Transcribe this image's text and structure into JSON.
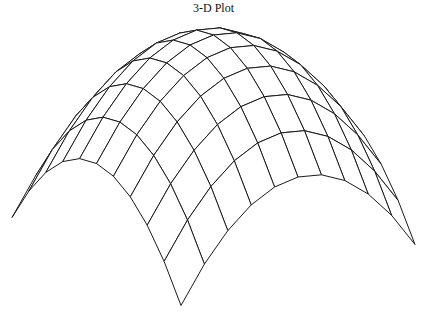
{
  "chart_data": {
    "type": "surface-wireframe",
    "title": "3-D Plot",
    "xlabel": "",
    "ylabel": "",
    "zlabel": "",
    "axes_visible": false,
    "grid": false,
    "legend": null,
    "function": "z = -(x^2 + y^2)",
    "x_range": [
      -1,
      1
    ],
    "y_range": [
      -1,
      1
    ],
    "grid_points": 11,
    "z_range": [
      -2,
      0
    ],
    "line_color": "#1a1a1a",
    "fill_color": "#ffffff",
    "hidden_line_removal": true,
    "projection": {
      "origin_x": 213.5,
      "origin_y": 35,
      "ux": [
        84.5,
        44
      ],
      "vx": [
        -117,
        30.5
      ],
      "z_scale": 98
    }
  }
}
